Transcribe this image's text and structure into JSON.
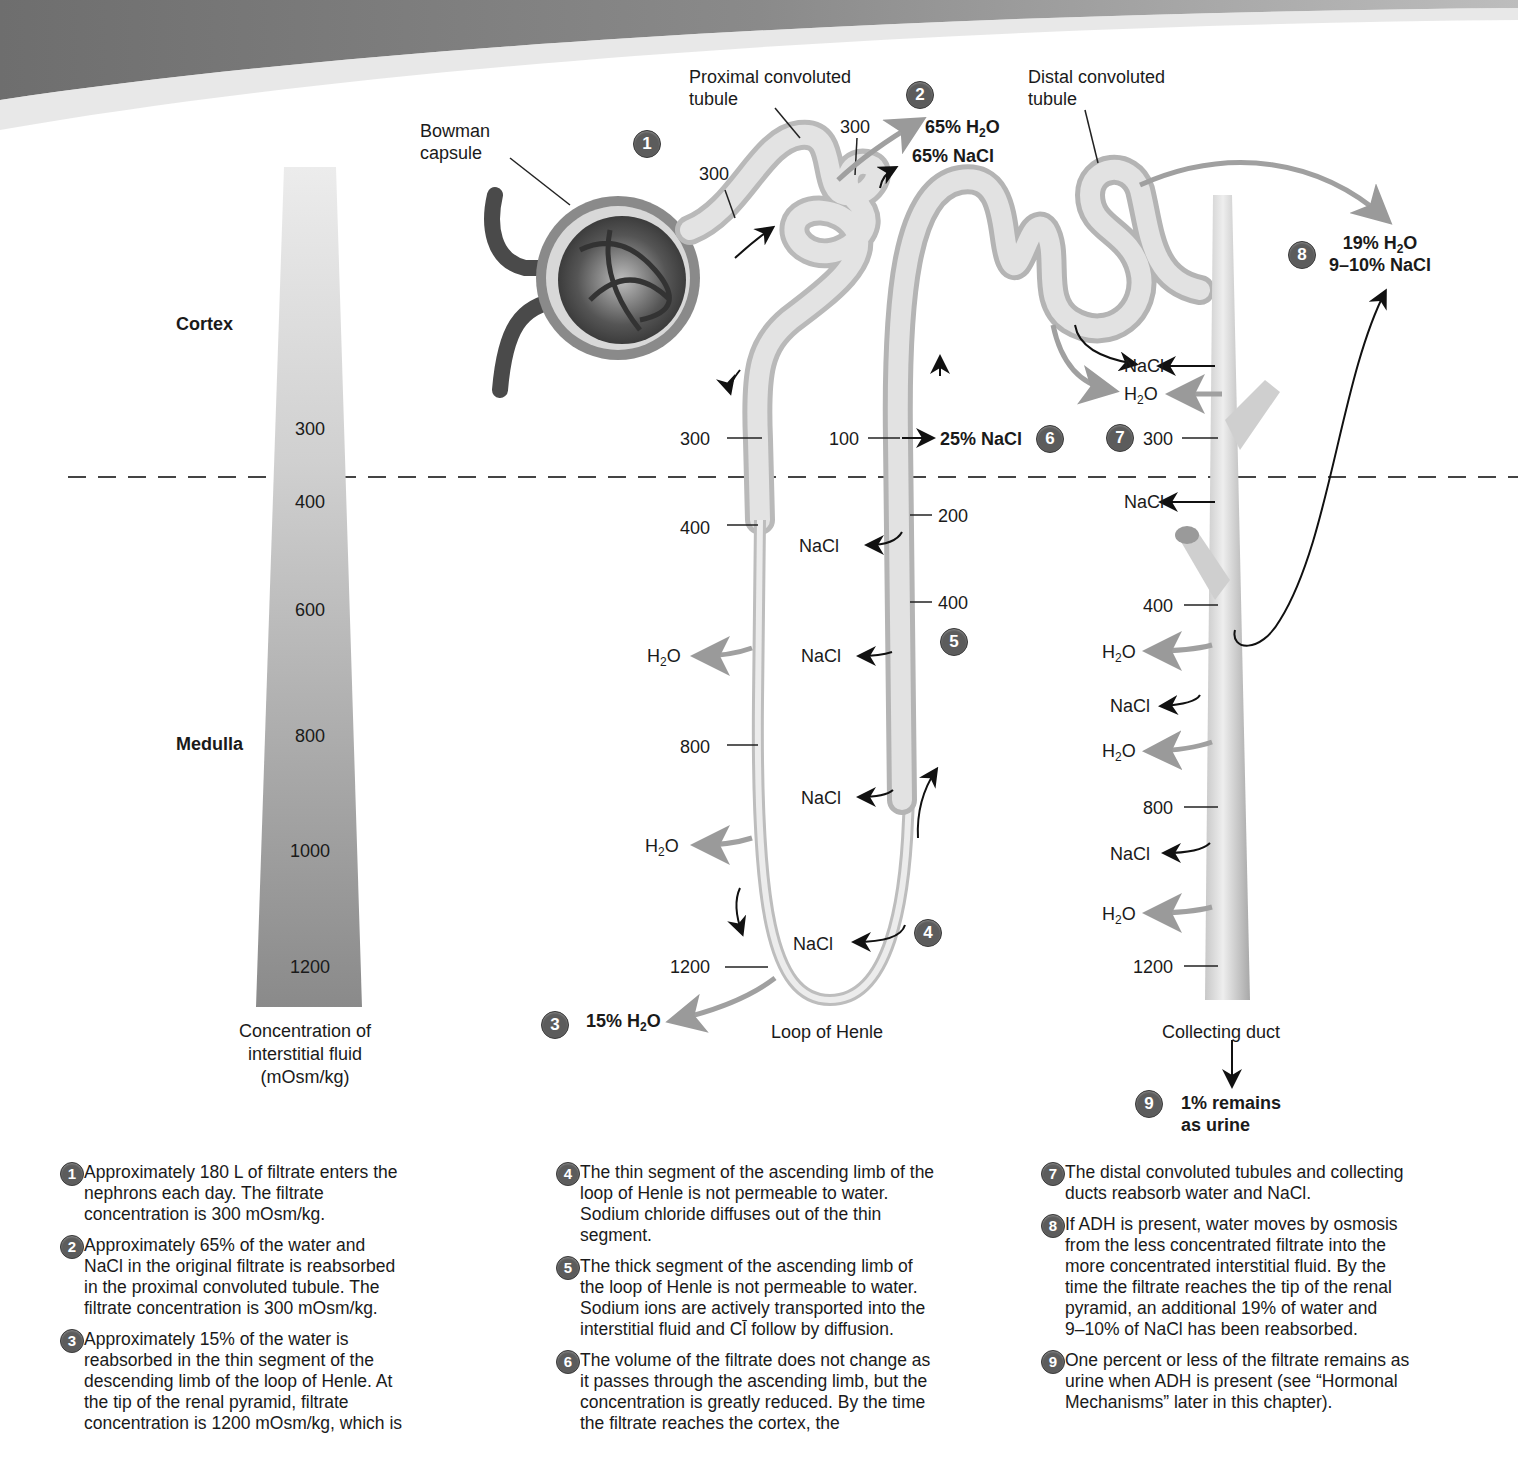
{
  "header_band": {
    "color": "#7a7a7a"
  },
  "gauge": {
    "regions": [
      {
        "label": "Cortex"
      },
      {
        "label": "Medulla"
      }
    ],
    "ticks": [
      "300",
      "400",
      "600",
      "800",
      "1000",
      "1200"
    ],
    "caption_lines": [
      "Concentration of",
      "interstitial fluid",
      "(mOsm/kg)"
    ]
  },
  "structures": {
    "bowman": {
      "line1": "Bowman",
      "line2": "capsule"
    },
    "proximal": {
      "line1": "Proximal convoluted",
      "line2": "tubule"
    },
    "distal": {
      "line1": "Distal convoluted",
      "line2": "tubule"
    },
    "loop": "Loop of Henle",
    "collecting": "Collecting duct"
  },
  "markers": [
    "1",
    "2",
    "3",
    "4",
    "5",
    "6",
    "7",
    "8",
    "9"
  ],
  "values": {
    "prox_a": "300",
    "prox_b": "300",
    "desc": [
      "300",
      "400",
      "800",
      "1200"
    ],
    "asc": [
      "100",
      "200",
      "400"
    ],
    "cd": [
      "300",
      "400",
      "800",
      "1200"
    ]
  },
  "callouts": {
    "c2_h2o_pct": "65% H",
    "c2_h2o_sub": "2",
    "c2_h2o_tail": "O",
    "c2_nacl": "65% NaCl",
    "c3_pct": "15% H",
    "c3_sub": "2",
    "c3_tail": "O",
    "c6": "25% NaCl",
    "c8_pct": "19% H",
    "c8_sub": "2",
    "c8_tail": "O",
    "c8_nacl": "9–10% NaCl",
    "c9_line1": "1% remains",
    "c9_line2": "as urine"
  },
  "ions": {
    "nacl": "NaCl",
    "h": "H",
    "two": "2",
    "o": "O"
  },
  "descriptions": {
    "col1": [
      {
        "n": "1",
        "lines": [
          "Approximately 180 L of filtrate enters the",
          "nephrons each day. The filtrate",
          "concentration is 300 mOsm/kg."
        ]
      },
      {
        "n": "2",
        "lines": [
          "Approximately 65% of the water and",
          "NaCl in the original filtrate is reabsorbed",
          "in the proximal convoluted tubule. The",
          "filtrate concentration is 300 mOsm/kg."
        ]
      },
      {
        "n": "3",
        "lines": [
          "Approximately 15% of the water is",
          "reabsorbed in the thin segment of the",
          "descending limb of the loop of Henle. At",
          "the tip of the renal pyramid, filtrate",
          "concentration is 1200 mOsm/kg, which is"
        ]
      }
    ],
    "col2": [
      {
        "n": "4",
        "lines": [
          "The thin segment of the ascending limb of the",
          "loop of Henle is not permeable to water.",
          "Sodium chloride diffuses out of the thin",
          "segment."
        ]
      },
      {
        "n": "5",
        "lines": [
          "The thick segment of the ascending limb of",
          "the loop of Henle is not permeable to water.",
          "Sodium ions are actively transported into the",
          "interstitial fluid and Cl̄ follow by diffusion."
        ]
      },
      {
        "n": "6",
        "lines": [
          "The volume of the filtrate does not change as",
          "it passes through the ascending limb, but the",
          "concentration is greatly reduced. By the time",
          "the filtrate reaches the cortex, the"
        ]
      }
    ],
    "col3": [
      {
        "n": "7",
        "lines": [
          "The distal convoluted tubules and collecting",
          "ducts reabsorb water and NaCl."
        ]
      },
      {
        "n": "8",
        "lines": [
          "If ADH is present, water moves by osmosis",
          "from the less concentrated filtrate into the",
          "more concentrated interstitial fluid. By the",
          "time the filtrate reaches the tip of the renal",
          "pyramid, an additional 19% of water and",
          "9–10% of NaCl has been reabsorbed."
        ]
      },
      {
        "n": "9",
        "lines": [
          "One percent or less of the filtrate remains as",
          "urine when ADH is present (see “Hormonal",
          "Mechanisms” later in this chapter)."
        ]
      }
    ]
  },
  "colors": {
    "tubule": "#d4d4d4",
    "arrow_gray": "#9a9a9a",
    "badge": "#5c5c5c",
    "divider": "#444444"
  }
}
